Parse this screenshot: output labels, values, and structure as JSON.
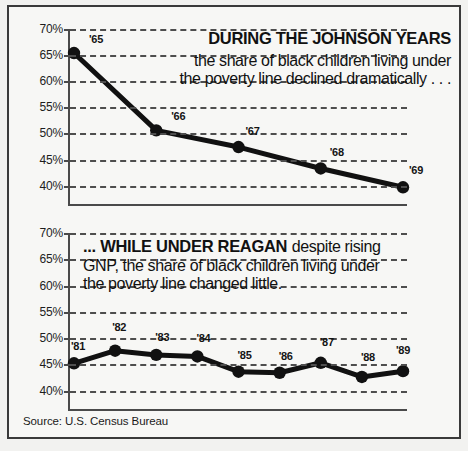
{
  "chart_data": [
    {
      "type": "line",
      "panel": "top",
      "title": "DURING THE JOHNSON YEARS",
      "annotation": "the share of black children living under the poverty line declined dramatically . . .",
      "categories": [
        "'65",
        "'66",
        "'67",
        "'68",
        "'69"
      ],
      "values": [
        65.4,
        50.6,
        47.4,
        43.3,
        39.7
      ],
      "point_labels": [
        "'65",
        "'66",
        "'67",
        "'68",
        "'69"
      ],
      "ytick_labels": [
        "70%",
        "65%",
        "60%",
        "55%",
        "50%",
        "45%",
        "40%"
      ],
      "yticks": [
        70,
        65,
        60,
        55,
        50,
        45,
        40
      ],
      "ylim": [
        36.5,
        70
      ],
      "xlabel": "",
      "ylabel": "",
      "grid": true,
      "legend": "none",
      "series_color": "#111111"
    },
    {
      "type": "line",
      "panel": "bottom",
      "title": "... WHILE UNDER REAGAN",
      "annotation": "despite rising GNP, the share of black children living under the poverty line changed little.",
      "categories": [
        "'81",
        "'82",
        "'83",
        "'84",
        "'85",
        "'86",
        "'87",
        "'88",
        "'89"
      ],
      "values": [
        45.2,
        47.6,
        46.8,
        46.5,
        43.6,
        43.4,
        45.3,
        42.6,
        43.7
      ],
      "point_labels": [
        "'81",
        "'82",
        "'83",
        "'84",
        "'85",
        "'86",
        "'87",
        "'88",
        "'89"
      ],
      "ytick_labels": [
        "70%",
        "65%",
        "60%",
        "55%",
        "50%",
        "45%",
        "40%"
      ],
      "yticks": [
        70,
        65,
        60,
        55,
        50,
        45,
        40
      ],
      "ylim": [
        36.5,
        70
      ],
      "xlabel": "",
      "ylabel": "",
      "grid": true,
      "legend": "none",
      "series_color": "#111111"
    }
  ],
  "top_panel": {
    "headline": "DURING THE JOHNSON YEARS",
    "body": "the share of black children living under the poverty line declined dramatically . . ."
  },
  "bottom_panel": {
    "headline": "... WHILE UNDER REAGAN",
    "body": "despite rising GNP, the share of black children living under the poverty line changed little."
  },
  "footer": {
    "source": "Source: U.S. Census Bureau"
  },
  "colors": {
    "ink": "#111111",
    "axis": "#4a4a4a",
    "grid": "#4e4e4e",
    "background": "#f7f7f5",
    "border": "#3a3a3a"
  }
}
